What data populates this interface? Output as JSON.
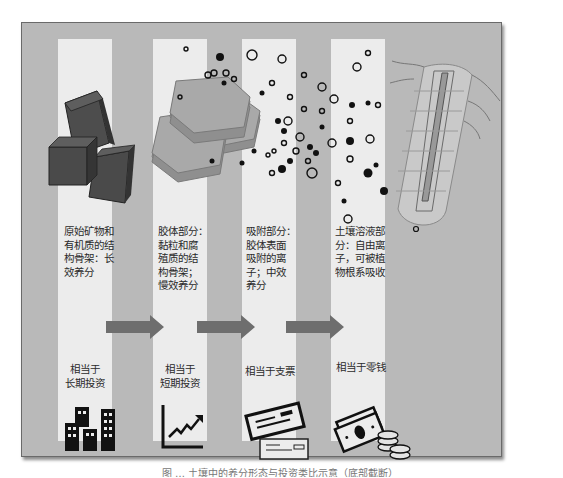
{
  "figure": {
    "caption_visible": "图 … 土壤中的养分形态与投资类比示意（底部截断）",
    "stages": [
      {
        "id": "structural",
        "graphic": "mineral-cubes",
        "description": "原始矿物和\n有机质的结\n构骨架：长\n效养分",
        "analogy": "相当于\n长期投资",
        "icon": "buildings-icon"
      },
      {
        "id": "colloid",
        "graphic": "layered-clay-hexagons",
        "description": "胶体部分：\n黏粒和腐\n殖质的结\n构骨架；\n慢效养分",
        "analogy": "相当于\n短期投资",
        "icon": "rising-chart-icon"
      },
      {
        "id": "adsorbed",
        "graphic": "adsorbed-ions",
        "description": "吸附部分：\n胶体表面\n吸附的离\n子；中效\n养分",
        "analogy": "相当于支票",
        "icon": "cheque-icon"
      },
      {
        "id": "solution",
        "graphic": "plant-root",
        "description": "土壤溶液部\n分：自由离\n子，可被植\n物根系吸收",
        "analogy": "相当于零钱",
        "icon": "cash-coins-icon"
      }
    ],
    "colors": {
      "panel_bg": "#b9b9b9",
      "column_bg": "#ececec",
      "arrow": "#6e6e6e",
      "cube_fill": "#4a4a4a",
      "hex_fill": "#a8a8a8"
    }
  }
}
